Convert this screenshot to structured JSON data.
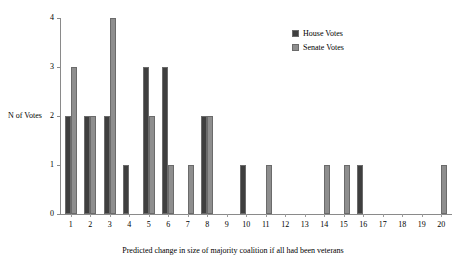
{
  "chart_data": {
    "type": "bar",
    "title": "",
    "subtitle": "",
    "xlabel": "Predicted change in size of majority coalition if all had been veterans",
    "ylabel": "N of Votes",
    "categories": [
      "1",
      "2",
      "3",
      "4",
      "5",
      "6",
      "7",
      "8",
      "9",
      "10",
      "11",
      "12",
      "13",
      "14",
      "15",
      "16",
      "17",
      "18",
      "19",
      "20"
    ],
    "series": [
      {
        "name": "House Votes",
        "color": "#3f3f3f",
        "values": [
          2,
          2,
          2,
          1,
          3,
          3,
          0,
          2,
          0,
          1,
          0,
          0,
          0,
          0,
          0,
          1,
          0,
          0,
          0,
          0
        ]
      },
      {
        "name": "Senate Votes",
        "color": "#8e8e8e",
        "values": [
          3,
          2,
          4,
          0,
          2,
          1,
          1,
          2,
          0,
          0,
          1,
          0,
          0,
          1,
          1,
          0,
          0,
          0,
          0,
          1
        ]
      }
    ],
    "ylim": [
      0,
      4
    ],
    "yticks": [
      0,
      1,
      2,
      3,
      4
    ],
    "ytick_labels": [
      "0",
      "1",
      "2",
      "3",
      "4"
    ],
    "grid": false,
    "legend_position": "top-right"
  },
  "legend": {
    "entries": [
      {
        "label": "House Votes",
        "swatch": "house"
      },
      {
        "label": "Senate Votes",
        "swatch": "senate"
      }
    ]
  },
  "axes": {
    "y_axis_label": "N of Votes",
    "x_axis_label": "Predicted change in size of majority coalition if all had been veterans"
  }
}
